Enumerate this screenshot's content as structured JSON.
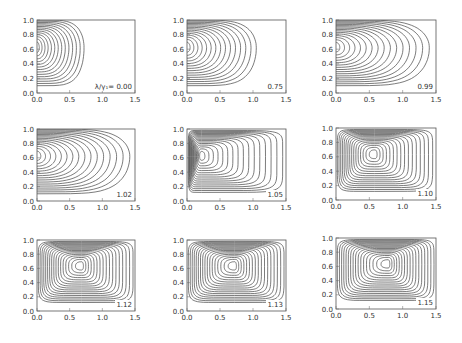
{
  "figure": {
    "parameter_label": "λ/γ₁=",
    "x_ticks": [
      "0.0",
      "0.5",
      "1.0",
      "1.5"
    ],
    "y_ticks": [
      "0.0",
      "0.2",
      "0.4",
      "0.6",
      "0.8",
      "1.0"
    ],
    "xlim": [
      0,
      1.5
    ],
    "ylim": [
      0,
      1.0
    ]
  },
  "chart_data": {
    "type": "contour",
    "title": "",
    "xlabel": "",
    "ylabel": "",
    "grid": false,
    "layout": "3x3 panels",
    "xlim": [
      0,
      1.5
    ],
    "ylim": [
      0,
      1.0
    ],
    "x_ticks": [
      0.0,
      0.5,
      1.0,
      1.5
    ],
    "y_ticks": [
      0.0,
      0.2,
      0.4,
      0.6,
      0.8,
      1.0
    ],
    "panel_parameter": "λ/γ₁",
    "panels": [
      {
        "label": "λ/γ₁=  0.00",
        "value": 0.0,
        "center_x": 0.0,
        "center_y": 0.62,
        "extent_x": 0.72,
        "n_contours": 14,
        "closed": false
      },
      {
        "label": "0.75",
        "value": 0.75,
        "center_x": 0.0,
        "center_y": 0.62,
        "extent_x": 1.05,
        "n_contours": 15,
        "closed": false
      },
      {
        "label": "0.99",
        "value": 0.99,
        "center_x": 0.0,
        "center_y": 0.62,
        "extent_x": 1.4,
        "n_contours": 16,
        "closed": false
      },
      {
        "label": "1.02",
        "value": 1.02,
        "center_x": 0.0,
        "center_y": 0.62,
        "extent_x": 1.42,
        "n_contours": 16,
        "closed": false
      },
      {
        "label": "1.05",
        "value": 1.05,
        "center_x": 0.22,
        "center_y": 0.62,
        "extent_x": 1.45,
        "n_contours": 16,
        "closed": true
      },
      {
        "label": "1.10",
        "value": 1.1,
        "center_x": 0.58,
        "center_y": 0.63,
        "extent_x": 1.45,
        "n_contours": 16,
        "closed": true
      },
      {
        "label": "1.12",
        "value": 1.12,
        "center_x": 0.68,
        "center_y": 0.63,
        "extent_x": 1.47,
        "n_contours": 17,
        "closed": true
      },
      {
        "label": "1.13",
        "value": 1.13,
        "center_x": 0.72,
        "center_y": 0.63,
        "extent_x": 1.47,
        "n_contours": 17,
        "closed": true
      },
      {
        "label": "1.15",
        "value": 1.15,
        "center_x": 0.78,
        "center_y": 0.63,
        "extent_x": 1.47,
        "n_contours": 17,
        "closed": true
      }
    ]
  },
  "layout": {
    "panel_boxes": [
      {
        "x": 37,
        "y": 20,
        "w": 98,
        "h": 73
      },
      {
        "x": 187,
        "y": 20,
        "w": 99,
        "h": 73
      },
      {
        "x": 336,
        "y": 20,
        "w": 100,
        "h": 73
      },
      {
        "x": 37,
        "y": 129,
        "w": 98,
        "h": 72
      },
      {
        "x": 187,
        "y": 129,
        "w": 99,
        "h": 72
      },
      {
        "x": 336,
        "y": 128,
        "w": 100,
        "h": 72
      },
      {
        "x": 37,
        "y": 240,
        "w": 98,
        "h": 71
      },
      {
        "x": 187,
        "y": 240,
        "w": 99,
        "h": 71
      },
      {
        "x": 336,
        "y": 238,
        "w": 100,
        "h": 71
      }
    ]
  }
}
